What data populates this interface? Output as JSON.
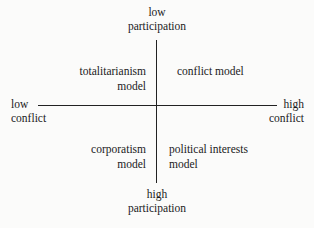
{
  "chart_data": {
    "type": "diagram",
    "title": "",
    "subtype": "two-by-two quadrant matrix",
    "xlabel": "conflict",
    "ylabel": "participation",
    "axes": {
      "vertical": {
        "name": "participation",
        "top_pole": {
          "line1": "low",
          "line2": "participation"
        },
        "bottom_pole": {
          "line1": "high",
          "line2": "participation"
        }
      },
      "horizontal": {
        "name": "conflict",
        "left_pole": {
          "line1": "low",
          "line2": "conflict"
        },
        "right_pole": {
          "line1": "high",
          "line2": "conflict"
        }
      }
    },
    "quadrants": [
      {
        "position": "top-left",
        "x": "low conflict",
        "y": "low participation",
        "line1": "totalitarianism",
        "line2": "model",
        "label": "totalitarianism model"
      },
      {
        "position": "top-right",
        "x": "high conflict",
        "y": "low participation",
        "line1": "conflict model",
        "line2": "",
        "label": "conflict model"
      },
      {
        "position": "bottom-left",
        "x": "low conflict",
        "y": "high participation",
        "line1": "corporatism",
        "line2": "model",
        "label": "corporatism model"
      },
      {
        "position": "bottom-right",
        "x": "high conflict",
        "y": "high participation",
        "line1": "political interests",
        "line2": "model",
        "label": "political interests model"
      }
    ],
    "colors": {
      "background": "#fbfbfa",
      "axis": "#222222",
      "text": "#1a1a1a"
    }
  }
}
